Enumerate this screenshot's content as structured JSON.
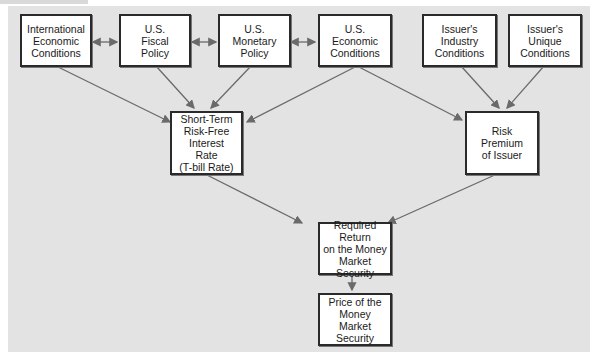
{
  "nodes": {
    "intl": {
      "label": "International\nEconomic\nConditions"
    },
    "fiscal": {
      "label": "U.S.\nFiscal\nPolicy"
    },
    "monetary": {
      "label": "U.S.\nMonetary\nPolicy"
    },
    "econ": {
      "label": "U.S.\nEconomic\nConditions"
    },
    "industry": {
      "label": "Issuer's\nIndustry\nConditions"
    },
    "unique": {
      "label": "Issuer's\nUnique\nConditions"
    },
    "riskfree": {
      "label": "Short-Term\nRisk-Free\nInterest\nRate\n(T-bill Rate)"
    },
    "premium": {
      "label": "Risk\nPremium\nof Issuer"
    },
    "required": {
      "label": "Required Return\non the Money\nMarket Security"
    },
    "price": {
      "label": "Price of the\nMoney Market\nSecurity"
    }
  },
  "colors": {
    "panel": "#e3e3e3",
    "line": "#6a6a6a",
    "border": "#2a2a2a"
  }
}
